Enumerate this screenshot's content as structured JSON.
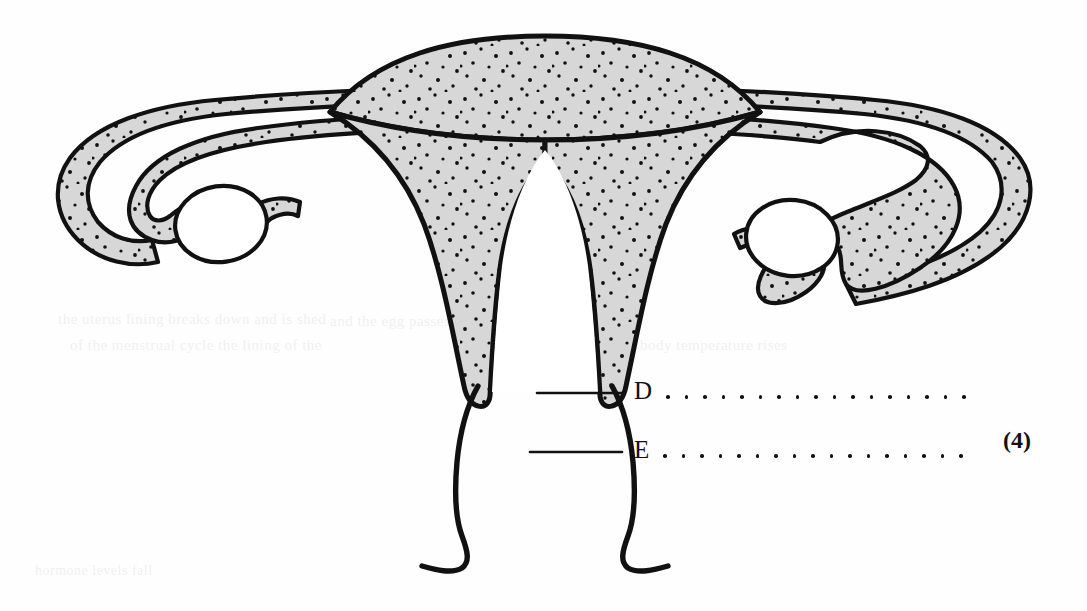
{
  "figure": {
    "style": {
      "outline_color": "#111111",
      "tissue_fill": "#d7d7d7",
      "stipple_color": "#101010",
      "cavity_fill": "#ffffff",
      "page_background": "#fefefe"
    },
    "parts": [
      {
        "id": "fundus",
        "name": "fundus-of-uterus",
        "shading": "stippled-gray"
      },
      {
        "id": "myometrium-left",
        "name": "uterine-wall-left",
        "shading": "stippled-gray"
      },
      {
        "id": "myometrium-right",
        "name": "uterine-wall-right",
        "shading": "stippled-gray"
      },
      {
        "id": "uterine-cavity",
        "name": "uterine-cavity",
        "shading": "white"
      },
      {
        "id": "tube-left",
        "name": "fallopian-tube-left",
        "shading": "stippled-gray"
      },
      {
        "id": "tube-right",
        "name": "fallopian-tube-right",
        "shading": "stippled-gray"
      },
      {
        "id": "fimbriae-left",
        "name": "fimbriae-left",
        "shading": "stippled-gray"
      },
      {
        "id": "fimbriae-right",
        "name": "fimbriae-right",
        "shading": "stippled-gray"
      },
      {
        "id": "ovary-left",
        "name": "ovary-left",
        "shading": "white-outline"
      },
      {
        "id": "ovary-right",
        "name": "ovary-right",
        "shading": "white-outline"
      },
      {
        "id": "cervix",
        "name": "cervix",
        "shading": "white-outline"
      },
      {
        "id": "vagina",
        "name": "vagina",
        "shading": "white-outline"
      }
    ]
  },
  "labels": {
    "rows": [
      {
        "letter": "D",
        "answer_value": "",
        "answer_placeholder": "",
        "dots": 17,
        "leader_from": {
          "x": 537,
          "y": 393
        },
        "leader_to": {
          "x": 622,
          "y": 393
        },
        "letter_x": 634,
        "letter_y": 380,
        "dots_x": 674,
        "dots_width": 296
      },
      {
        "letter": "E",
        "answer_value": "",
        "answer_placeholder": "",
        "dots": 17,
        "leader_from": {
          "x": 530,
          "y": 452
        },
        "leader_to": {
          "x": 622,
          "y": 452
        },
        "letter_x": 634,
        "letter_y": 440,
        "dots_x": 674,
        "dots_width": 296
      }
    ]
  },
  "marks": {
    "total": "(4)",
    "x": 1003,
    "y": 428
  },
  "bleed_through": {
    "note": "faint show-through text from reverse side of page",
    "lines": [
      {
        "text": "the uterus lining breaks down and is shed",
        "x": 58,
        "y": 318,
        "size": 15
      },
      {
        "text": "of the menstrual cycle the lining of the",
        "x": 70,
        "y": 344,
        "size": 15
      },
      {
        "text": "and the egg passes",
        "x": 330,
        "y": 320,
        "size": 15
      },
      {
        "text": "body temperature rises",
        "x": 640,
        "y": 344,
        "size": 15
      },
      {
        "text": "hormone levels fall",
        "x": 35,
        "y": 570,
        "size": 14
      }
    ]
  }
}
